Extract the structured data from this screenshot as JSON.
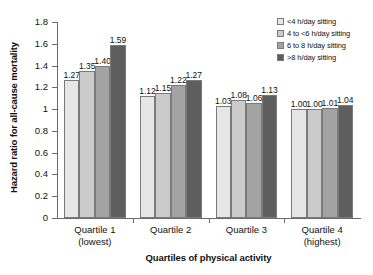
{
  "chart_data": {
    "type": "bar",
    "title": "",
    "xlabel": "Quartiles of physical activity",
    "ylabel": "Hazard ratio for all-cause mortality",
    "categories": [
      "Quartile 1",
      "Quartile 2",
      "Quartile 3",
      "Quartile 4"
    ],
    "category_sublabels": [
      "(lowest)",
      "",
      "",
      "(highest)"
    ],
    "series": [
      {
        "name": "<4 h/day sitting",
        "color": "#e6e6e6",
        "values": [
          1.27,
          1.12,
          1.03,
          1.0
        ]
      },
      {
        "name": "4 to <6 h/day sitting",
        "color": "#cbcbcb",
        "values": [
          1.35,
          1.15,
          1.08,
          1.0
        ]
      },
      {
        "name": "6 to 8 h/day sitting",
        "color": "#a3a3a3",
        "values": [
          1.4,
          1.22,
          1.06,
          1.01
        ]
      },
      {
        "name": ">8 h/day sitting",
        "color": "#5e5e5e",
        "values": [
          1.59,
          1.27,
          1.13,
          1.04
        ]
      }
    ],
    "value_labels": [
      [
        "1.27",
        "1.35",
        "1.40",
        "1.59"
      ],
      [
        "1.12",
        "1.15",
        "1.22",
        "1.27"
      ],
      [
        "1.03",
        "1.08",
        "1.06",
        "1.13"
      ],
      [
        "1.00",
        "1.00",
        "1.01",
        "1.04"
      ]
    ],
    "ylim": [
      0,
      1.8
    ],
    "ytick_labels": [
      "0",
      "0.2",
      "0.4",
      "0.6",
      "0.8",
      "1",
      "1.2",
      "1.4",
      "1.6",
      "1.8"
    ],
    "ytick_values": [
      0,
      0.2,
      0.4,
      0.6,
      0.8,
      1.0,
      1.2,
      1.4,
      1.6,
      1.8
    ],
    "grid": false,
    "legend_position": "top-right",
    "axis_color": "#6b6b6b",
    "bar_border_color": "#7a7a7a"
  }
}
